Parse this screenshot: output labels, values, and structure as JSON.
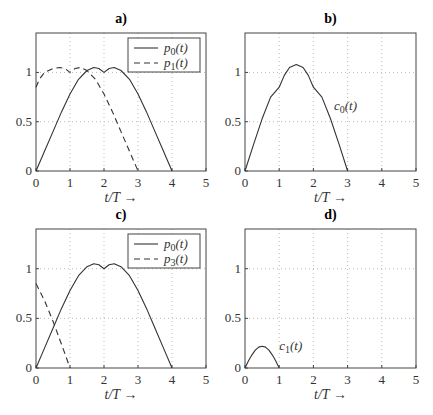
{
  "chart_data": [
    {
      "panel": "a",
      "type": "line",
      "title": "a)",
      "xlabel": "t/T →",
      "ylabel": "",
      "xlim": [
        0,
        5
      ],
      "ylim": [
        0,
        1.4
      ],
      "xticks": [
        0,
        1,
        2,
        3,
        4,
        5
      ],
      "yticks": [
        0,
        0.5,
        1
      ],
      "ytick_labels": [
        "0",
        "0.5",
        "1"
      ],
      "grid": true,
      "legend": {
        "position": "upper right",
        "entries": [
          "p0(t)",
          "p1(t)"
        ]
      },
      "series": [
        {
          "name": "p0(t)",
          "style": "solid",
          "x": [
            0,
            0.25,
            0.5,
            0.75,
            1.0,
            1.25,
            1.5,
            1.7,
            1.85,
            2.0,
            2.15,
            2.3,
            2.5,
            2.75,
            3.0,
            3.25,
            3.5,
            3.75,
            4.0
          ],
          "y": [
            0,
            0.2,
            0.4,
            0.6,
            0.78,
            0.93,
            1.02,
            1.05,
            1.04,
            1.0,
            1.04,
            1.05,
            1.02,
            0.93,
            0.78,
            0.6,
            0.4,
            0.2,
            0
          ]
        },
        {
          "name": "p1(t)",
          "style": "dashed",
          "x": [
            0,
            0.1,
            0.25,
            0.5,
            0.7,
            0.85,
            1.0,
            1.15,
            1.3,
            1.5,
            1.75,
            2.0,
            2.25,
            2.5,
            2.75,
            3.0
          ],
          "y": [
            0.85,
            0.93,
            1.0,
            1.04,
            1.05,
            1.04,
            1.0,
            1.04,
            1.05,
            1.02,
            0.93,
            0.78,
            0.6,
            0.4,
            0.2,
            0
          ]
        }
      ]
    },
    {
      "panel": "b",
      "type": "line",
      "title": "b)",
      "xlabel": "t/T →",
      "ylabel": "",
      "xlim": [
        0,
        5
      ],
      "ylim": [
        0,
        1.4
      ],
      "xticks": [
        0,
        1,
        2,
        3,
        4,
        5
      ],
      "yticks": [
        0,
        0.5,
        1
      ],
      "ytick_labels": [
        "0",
        "0.5",
        "1"
      ],
      "grid": true,
      "annotations": [
        {
          "text": "c0(t)",
          "x": 2.6,
          "y": 0.62
        }
      ],
      "series": [
        {
          "name": "c0(t)",
          "style": "solid",
          "x": [
            0,
            0.25,
            0.5,
            0.75,
            1.0,
            1.15,
            1.3,
            1.5,
            1.7,
            1.85,
            2.0,
            2.25,
            2.5,
            2.75,
            3.0
          ],
          "y": [
            0,
            0.27,
            0.53,
            0.75,
            0.85,
            0.97,
            1.05,
            1.08,
            1.05,
            0.97,
            0.85,
            0.75,
            0.53,
            0.27,
            0
          ]
        }
      ]
    },
    {
      "panel": "c",
      "type": "line",
      "title": "c)",
      "xlabel": "t/T →",
      "ylabel": "",
      "xlim": [
        0,
        5
      ],
      "ylim": [
        0,
        1.4
      ],
      "xticks": [
        0,
        1,
        2,
        3,
        4,
        5
      ],
      "yticks": [
        0,
        0.5,
        1
      ],
      "ytick_labels": [
        "0",
        "0.5",
        "1"
      ],
      "grid": true,
      "legend": {
        "position": "upper right",
        "entries": [
          "p0(t)",
          "p3(t)"
        ]
      },
      "series": [
        {
          "name": "p0(t)",
          "style": "solid",
          "x": [
            0,
            0.25,
            0.5,
            0.75,
            1.0,
            1.25,
            1.5,
            1.7,
            1.85,
            2.0,
            2.15,
            2.3,
            2.5,
            2.75,
            3.0,
            3.25,
            3.5,
            3.75,
            4.0
          ],
          "y": [
            0,
            0.2,
            0.4,
            0.6,
            0.78,
            0.93,
            1.02,
            1.05,
            1.04,
            1.0,
            1.04,
            1.05,
            1.02,
            0.93,
            0.78,
            0.6,
            0.4,
            0.2,
            0
          ]
        },
        {
          "name": "p3(t)",
          "style": "dashed",
          "x": [
            0,
            0.25,
            0.5,
            0.75,
            1.0
          ],
          "y": [
            0.85,
            0.68,
            0.47,
            0.24,
            0
          ]
        }
      ]
    },
    {
      "panel": "d",
      "type": "line",
      "title": "d)",
      "xlabel": "t/T →",
      "ylabel": "",
      "xlim": [
        0,
        5
      ],
      "ylim": [
        0,
        1.4
      ],
      "xticks": [
        0,
        1,
        2,
        3,
        4,
        5
      ],
      "yticks": [
        0,
        0.5,
        1
      ],
      "ytick_labels": [
        "0",
        "0.5",
        "1"
      ],
      "grid": true,
      "annotations": [
        {
          "text": "c1(t)",
          "x": 1.0,
          "y": 0.18
        }
      ],
      "series": [
        {
          "name": "c1(t)",
          "style": "solid",
          "x": [
            0,
            0.1,
            0.2,
            0.3,
            0.4,
            0.5,
            0.6,
            0.7,
            0.8,
            0.9,
            1.0
          ],
          "y": [
            0,
            0.07,
            0.13,
            0.18,
            0.21,
            0.22,
            0.21,
            0.18,
            0.13,
            0.07,
            0
          ]
        }
      ]
    }
  ],
  "layout": {
    "panels": [
      {
        "left": 36,
        "top": 33,
        "width": 170,
        "height": 138
      },
      {
        "left": 245,
        "top": 33,
        "width": 171,
        "height": 138
      },
      {
        "left": 36,
        "top": 229,
        "width": 170,
        "height": 139
      },
      {
        "left": 245,
        "top": 229,
        "width": 171,
        "height": 139
      }
    ],
    "colors": {
      "line": "#333333",
      "frame": "#444444",
      "grid": "#bbbbbb"
    }
  }
}
